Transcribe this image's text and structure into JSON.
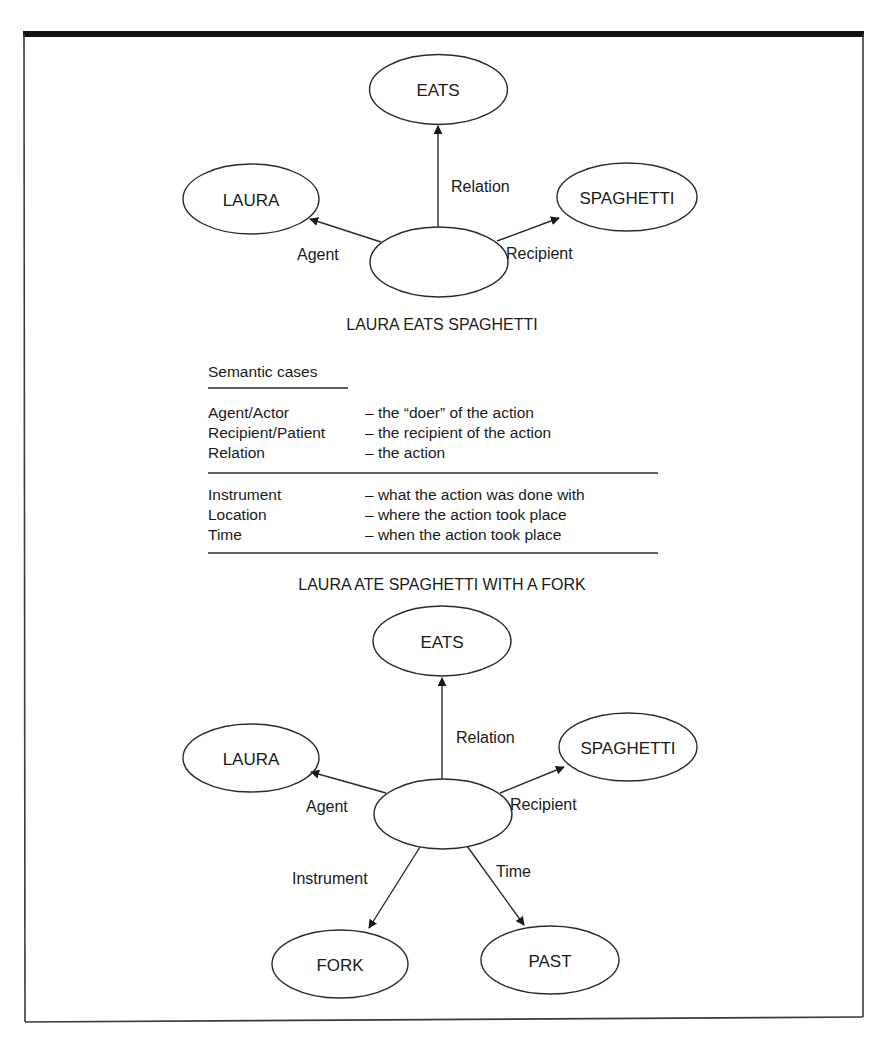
{
  "figure": {
    "frame": {
      "stroke": "#2b2b2b",
      "top_bar": "#111111"
    },
    "diagram1": {
      "caption": "LAURA EATS SPAGHETTI",
      "nodes": {
        "relation": "EATS",
        "agent": "LAURA",
        "recipient": "SPAGHETTI",
        "center": ""
      },
      "edges": {
        "relation": "Relation",
        "agent": "Agent",
        "recipient": "Recipient"
      }
    },
    "semantic_cases": {
      "heading": "Semantic cases",
      "primary": [
        {
          "case": "Agent/Actor",
          "description": "– the “doer” of the action"
        },
        {
          "case": "Recipient/Patient",
          "description": "– the recipient of the action"
        },
        {
          "case": "Relation",
          "description": "– the action"
        }
      ],
      "secondary": [
        {
          "case": "Instrument",
          "description": "– what the action was done with"
        },
        {
          "case": "Location",
          "description": "– where the action took place"
        },
        {
          "case": "Time",
          "description": "– when the action took place"
        }
      ]
    },
    "diagram2": {
      "caption": "LAURA ATE SPAGHETTI WITH A FORK",
      "nodes": {
        "relation": "EATS",
        "agent": "LAURA",
        "recipient": "SPAGHETTI",
        "instrument": "FORK",
        "time": "PAST",
        "center": ""
      },
      "edges": {
        "relation": "Relation",
        "agent": "Agent",
        "recipient": "Recipient",
        "instrument": "Instrument",
        "time": "Time"
      }
    }
  }
}
